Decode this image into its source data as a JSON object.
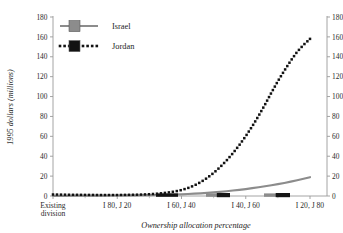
{
  "chart_data": {
    "type": "line",
    "title": "",
    "xlabel": "Ownership allocation percentage",
    "ylabel": "1995 dollars (millions)",
    "ylabel_right": "",
    "ylim": [
      0,
      180
    ],
    "yticks": [
      0,
      20,
      40,
      60,
      80,
      100,
      120,
      140,
      160,
      180
    ],
    "yticks_right": [
      0,
      20,
      40,
      60,
      80,
      100,
      120,
      140,
      160,
      180
    ],
    "grid": false,
    "legend_position": "top-left",
    "dual_axis": true,
    "xtick_labels": [
      "Existing division",
      "I 80, J 20",
      "I 60, J 40",
      "I 40, J 60",
      "I 20, J 80"
    ],
    "xtick_label_lines": [
      [
        "Existing",
        "division"
      ],
      [
        "I 80, J 20"
      ],
      [
        "I 60, J 40"
      ],
      [
        "I 40, J 60"
      ],
      [
        "I 20, J 80"
      ]
    ],
    "x": [
      0,
      1,
      2,
      3,
      4,
      5,
      6,
      7,
      8,
      9,
      10,
      11,
      12,
      13,
      14,
      15,
      16,
      17,
      18,
      19,
      20,
      21,
      22,
      23,
      24,
      25,
      26,
      27,
      28,
      29,
      30,
      31,
      32,
      33,
      34,
      35,
      36,
      37,
      38,
      39,
      40
    ],
    "series": [
      {
        "name": "Israel",
        "color": "#8c8c8c",
        "style": "solid",
        "marker": "square",
        "values": [
          0.2,
          0.2,
          0.2,
          0.3,
          0.3,
          0.3,
          0.4,
          0.4,
          0.4,
          0.5,
          0.5,
          0.6,
          0.6,
          0.7,
          0.8,
          0.9,
          1.0,
          1.1,
          1.3,
          1.5,
          1.7,
          2.0,
          2.3,
          2.7,
          3.1,
          3.6,
          4.2,
          4.8,
          5.5,
          6.2,
          7.0,
          7.9,
          8.8,
          9.8,
          10.8,
          11.9,
          13.1,
          14.4,
          15.8,
          17.3,
          18.9
        ]
      },
      {
        "name": "Jordan",
        "color": "#121212",
        "style": "dotted",
        "marker": "square",
        "values": [
          1.5,
          1.4,
          1.3,
          1.2,
          1.2,
          1.1,
          1.1,
          1.0,
          1.0,
          1.0,
          1.0,
          1.1,
          1.2,
          1.3,
          1.5,
          1.8,
          2.2,
          2.8,
          3.6,
          4.6,
          6.0,
          8.0,
          10.6,
          14.0,
          18.2,
          23.2,
          29.0,
          35.6,
          43.0,
          51.2,
          60.2,
          70.0,
          80.6,
          92.0,
          104.0,
          115.5,
          126.0,
          136.0,
          145.0,
          152.0,
          158.0
        ]
      }
    ],
    "marker_clusters": [
      {
        "series": "Jordan",
        "x_px": 156,
        "width_px": 22
      },
      {
        "series": "Israel",
        "x_px": 206,
        "width_px": 24
      },
      {
        "series": "Israel",
        "x_px": 264,
        "width_px": 26
      }
    ]
  },
  "legend": {
    "items": [
      {
        "label": "Israel",
        "color": "#8c8c8c",
        "style": "solid"
      },
      {
        "label": "Jordan",
        "color": "#121212",
        "style": "dotted"
      }
    ]
  }
}
